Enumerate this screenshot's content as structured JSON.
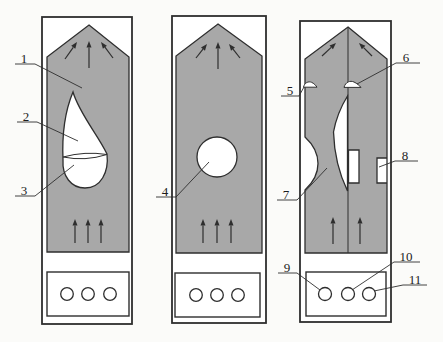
{
  "figure": {
    "canvas": {
      "width": 443,
      "height": 342,
      "background": "#fbfbf9"
    },
    "colors": {
      "panel_fill": "#ffffff",
      "gray_fill": "#a8a8a8",
      "line": "#2e2e2e",
      "label_color": "#1c1c1c"
    },
    "panels": [
      {
        "name": "panel-left",
        "outer": [
          42,
          17,
          90,
          307
        ],
        "body_path": "M89,25 L129,57 L129,252 L47,252 L47,57 Z M73,92 C79,113 98,135 107,154 C109,172 101,188 85,188 C71,188 62,176 63,160 C62,137 65,111 73,92 Z",
        "overlay_paths": [
          "M63,157 Q85,151 107,154.5 Q85,161.5 63,157 Z"
        ],
        "lines": [],
        "arrows": [
          [
            65,
            59,
            77,
            42
          ],
          [
            89,
            68,
            89,
            41
          ],
          [
            113,
            58,
            101,
            42
          ],
          [
            75,
            243,
            75,
            219
          ],
          [
            88,
            243,
            88,
            219
          ],
          [
            101,
            243,
            101,
            219
          ]
        ],
        "bottom_box": [
          47,
          272,
          82,
          44
        ],
        "holes": [
          [
            67,
            294
          ],
          [
            88,
            294
          ],
          [
            110,
            294
          ]
        ],
        "hole_r": 6.3
      },
      {
        "name": "panel-middle",
        "outer": [
          172,
          16,
          94,
          307
        ],
        "body_path": "M218,24 L262,56 L262,253 L176,253 L176,56 Z M237,157 A20,20 0 1 1 197,157 A20,20 0 1 1 237,157 Z",
        "overlay_paths": [],
        "lines": [],
        "arrows": [
          [
            196,
            58,
            207,
            44
          ],
          [
            218,
            69,
            218,
            42
          ],
          [
            240,
            58,
            229,
            44
          ],
          [
            203,
            243,
            203,
            219
          ],
          [
            217,
            243,
            217,
            219
          ],
          [
            231,
            243,
            231,
            219
          ]
        ],
        "bottom_box": [
          175,
          273,
          85,
          44
        ],
        "holes": [
          [
            196,
            295
          ],
          [
            217,
            295
          ],
          [
            238,
            295
          ]
        ],
        "hole_r": 6.3
      },
      {
        "name": "panel-right",
        "outer": [
          300,
          21,
          91,
          301
        ],
        "body_path": "M348,27 L387,59 L387,253 L305,253 L305,190 Q318,178 318,163.5 Q318,149 305,137 L305,59 Z M347.5,96 Q337,113 333.5,132 Q334.5,164 347.5,191 Z M348.5,150 L359,150 L359,183 L348.5,183 Z M377,158 L387,158 L387,183 L377,183 Z",
        "overlay_paths": [
          "M303.5,87.2 C304.5,82.6 308.5,81 311.5,82.3 C314,83.4 315.8,85.4 317,87.2 Z",
          "M344,87.4 C345.5,81.8 350.2,80.3 354,82 C357,83.4 359.6,85.7 361,87.4 Z"
        ],
        "lines": [
          [
            348,
            28,
            348,
            253
          ]
        ],
        "arrows": [
          [
            322,
            56,
            336,
            43
          ],
          [
            372,
            56,
            359,
            43
          ],
          [
            333,
            244,
            333,
            217
          ],
          [
            360,
            244,
            360,
            217
          ]
        ],
        "bottom_box": [
          306,
          272,
          80,
          44
        ],
        "holes": [
          [
            325,
            294
          ],
          [
            348,
            294
          ],
          [
            369,
            294
          ]
        ],
        "hole_r": 6.5
      }
    ],
    "labels": [
      {
        "text": "1",
        "x": 24,
        "y": 58,
        "underline": [
          15,
          64,
          35,
          64
        ],
        "leader": [
          35,
          64,
          82,
          88
        ]
      },
      {
        "text": "2",
        "x": 26,
        "y": 116,
        "underline": [
          17,
          122,
          37,
          122
        ],
        "leader": [
          37,
          122,
          78,
          141
        ]
      },
      {
        "text": "3",
        "x": 24,
        "y": 190,
        "underline": [
          15,
          196,
          35,
          196
        ],
        "leader": [
          35,
          196,
          74,
          165
        ]
      },
      {
        "text": "4",
        "x": 165,
        "y": 191,
        "underline": [
          156,
          197,
          176,
          197
        ],
        "leader": [
          176,
          197,
          209,
          162
        ]
      },
      {
        "text": "5",
        "x": 290,
        "y": 90,
        "underline": [
          281,
          96,
          299,
          96
        ],
        "leader": [
          299,
          96,
          304,
          87
        ]
      },
      {
        "text": "6",
        "x": 406,
        "y": 57,
        "underline": [
          396,
          63,
          420,
          63
        ],
        "leader": [
          396,
          63,
          357,
          84
        ]
      },
      {
        "text": "7",
        "x": 286,
        "y": 194,
        "underline": [
          277,
          200,
          297,
          200
        ],
        "leader": [
          297,
          200,
          327,
          168
        ]
      },
      {
        "text": "8",
        "x": 405,
        "y": 155,
        "underline": [
          395,
          161,
          418,
          161
        ],
        "leader": [
          395,
          161,
          379,
          167
        ]
      },
      {
        "text": "9",
        "x": 287,
        "y": 267,
        "underline": [
          278,
          273,
          297,
          273
        ],
        "leader": [
          297,
          273,
          320,
          290
        ]
      },
      {
        "text": "10",
        "x": 406,
        "y": 256,
        "underline": [
          394,
          262,
          420,
          262
        ],
        "leader": [
          394,
          262,
          352,
          290
        ]
      },
      {
        "text": "11",
        "x": 415,
        "y": 279,
        "underline": [
          403,
          285,
          427,
          285
        ],
        "leader": [
          403,
          285,
          374,
          291
        ]
      }
    ]
  }
}
